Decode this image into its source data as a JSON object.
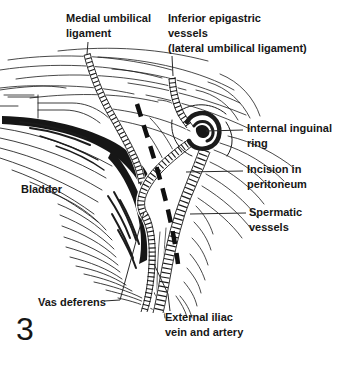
{
  "figure": {
    "number": "3",
    "ink_color": "#1b1b1b",
    "background_color": "#ffffff"
  },
  "labels": {
    "medial_umbilical": "Medial umbilical\nligament",
    "inferior_epigastric": "Inferior epigastric\nvessels\n(lateral umbilical ligament)",
    "internal_ring": "Internal inguinal\nring",
    "incision": "Incision in\nperitoneum",
    "spermatic": "Spermatic\nvessels",
    "bladder": "Bladder",
    "vas_deferens": "Vas deferens",
    "external_iliac": "External iliac\nvein and artery"
  }
}
